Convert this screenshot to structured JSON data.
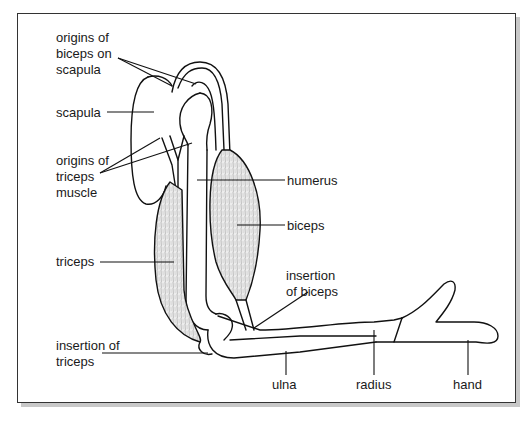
{
  "diagram": {
    "labels": {
      "origins_biceps": "origins of\nbiceps on\nscapula",
      "scapula": "scapula",
      "origins_triceps": "origins of\ntriceps\nmuscle",
      "humerus": "humerus",
      "biceps": "biceps",
      "triceps": "triceps",
      "insertion_biceps": "insertion\nof biceps",
      "insertion_triceps": "insertion of\ntriceps",
      "ulna": "ulna",
      "radius": "radius",
      "hand": "hand"
    },
    "colors": {
      "line": "#111111",
      "frame": "#333333",
      "shadow": "#c8c8c8",
      "muscle_fill": "#e6e6e6"
    }
  }
}
